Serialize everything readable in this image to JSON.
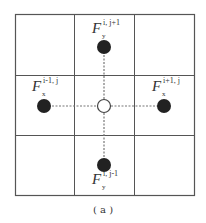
{
  "diagram": {
    "type": "stencil-grid",
    "grid": {
      "rows": 3,
      "cols": 3,
      "line_color": "#555555"
    },
    "center_node": {
      "shape": "hollow-circle",
      "fill": "#ffffff"
    },
    "neighbor_nodes": [
      {
        "id": "top",
        "F": "F",
        "superscript": "i, j+1",
        "subscript": "y",
        "fill": "#222222"
      },
      {
        "id": "left",
        "F": "F",
        "superscript": "i-1, j",
        "subscript": "x",
        "fill": "#222222"
      },
      {
        "id": "right",
        "F": "F",
        "superscript": "i+1, j",
        "subscript": "x",
        "fill": "#222222"
      },
      {
        "id": "bottom",
        "F": "F",
        "superscript": "i, j-1",
        "subscript": "y",
        "fill": "#222222"
      }
    ],
    "connector_style": "dashed",
    "caption": "( a )"
  }
}
